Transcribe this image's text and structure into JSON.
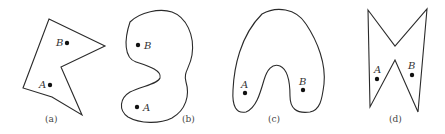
{
  "figure": {
    "panels": [
      {
        "id": "a",
        "caption": "(a)",
        "shape": "concave polygon",
        "points": [
          {
            "label": "B",
            "x": 67,
            "y": 43
          },
          {
            "label": "A",
            "x": 50,
            "y": 85
          }
        ]
      },
      {
        "id": "b",
        "caption": "(b)",
        "shape": "bean-shaped closed curve",
        "points": [
          {
            "label": "B",
            "x": 138,
            "y": 45
          },
          {
            "label": "A",
            "x": 137,
            "y": 107
          }
        ]
      },
      {
        "id": "c",
        "caption": "(c)",
        "shape": "horseshoe-shaped closed curve",
        "points": [
          {
            "label": "A",
            "x": 245,
            "y": 93
          },
          {
            "label": "B",
            "x": 303,
            "y": 90
          }
        ]
      },
      {
        "id": "d",
        "caption": "(d)",
        "shape": "bow-tie polygon",
        "points": [
          {
            "label": "A",
            "x": 377,
            "y": 79
          },
          {
            "label": "B",
            "x": 412,
            "y": 75
          }
        ]
      }
    ]
  }
}
